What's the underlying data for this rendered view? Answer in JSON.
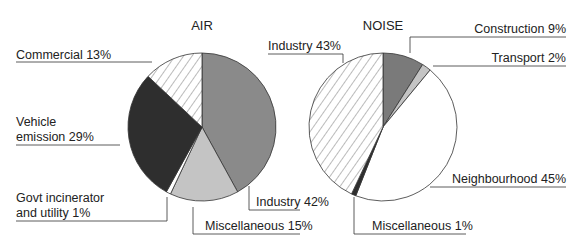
{
  "chart_data": [
    {
      "type": "pie",
      "title": "AIR",
      "slices": [
        {
          "label": "Industry",
          "value": 42,
          "fill": "#8a8a8a",
          "pattern": "solid"
        },
        {
          "label": "Miscellaneous",
          "value": 15,
          "fill": "#c4c4c4",
          "pattern": "solid"
        },
        {
          "label": "Govt incinerator and utility",
          "value": 1,
          "fill": "#ffffff",
          "pattern": "solid"
        },
        {
          "label": "Vehicle emission",
          "value": 29,
          "fill": "#2e2e2e",
          "pattern": "solid"
        },
        {
          "label": "Commercial",
          "value": 13,
          "fill": "#ffffff",
          "pattern": "hatch"
        }
      ],
      "labels": {
        "industry": "Industry 42%",
        "miscellaneous": "Miscellaneous 15%",
        "govt_line1": "Govt incinerator",
        "govt_line2": "and utility 1%",
        "vehicle_line1": "Vehicle",
        "vehicle_line2": "emission 29%",
        "commercial": "Commercial 13%"
      }
    },
    {
      "type": "pie",
      "title": "NOISE",
      "slices": [
        {
          "label": "Construction",
          "value": 9,
          "fill": "#7a7a7a",
          "pattern": "solid"
        },
        {
          "label": "Transport",
          "value": 2,
          "fill": "#c4c4c4",
          "pattern": "solid"
        },
        {
          "label": "Neighbourhood",
          "value": 45,
          "fill": "#ffffff",
          "pattern": "solid"
        },
        {
          "label": "Miscellaneous",
          "value": 1,
          "fill": "#2e2e2e",
          "pattern": "solid"
        },
        {
          "label": "Industry",
          "value": 43,
          "fill": "#ffffff",
          "pattern": "hatch"
        }
      ],
      "labels": {
        "construction": "Construction 9%",
        "transport": "Transport 2%",
        "neighbourhood": "Neighbourhood 45%",
        "miscellaneous": "Miscellaneous 1%",
        "industry": "Industry 43%"
      }
    }
  ]
}
